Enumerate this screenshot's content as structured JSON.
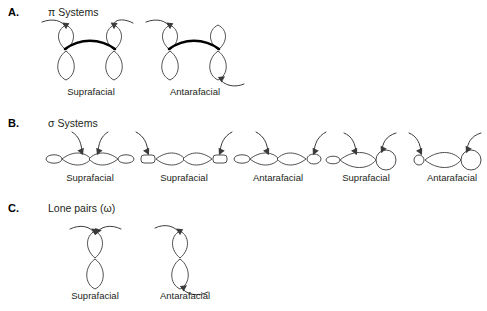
{
  "figure": {
    "background": "#ffffff",
    "line_color": "#4d4d4d",
    "bond_color": "#000000",
    "text_color": "#231f20"
  },
  "sections": [
    {
      "letter": "A.",
      "title": "π Systems",
      "items": [
        {
          "caption": "Suprafacial",
          "orbital": "pi-pair",
          "mode": "suprafacial"
        },
        {
          "caption": "Antarafacial",
          "orbital": "pi-pair",
          "mode": "antarafacial"
        }
      ]
    },
    {
      "letter": "B.",
      "title": "σ Systems",
      "items": [
        {
          "caption": "Suprafacial",
          "orbital": "sigma-symmetric",
          "mode": "suprafacial"
        },
        {
          "caption": "Suprafacial",
          "orbital": "sigma-symmetric",
          "mode": "suprafacial"
        },
        {
          "caption": "Antarafacial",
          "orbital": "sigma-symmetric",
          "mode": "antarafacial"
        },
        {
          "caption": "Suprafacial",
          "orbital": "sigma-hybrid",
          "mode": "suprafacial"
        },
        {
          "caption": "Antarafacial",
          "orbital": "sigma-hybrid",
          "mode": "antarafacial"
        }
      ]
    },
    {
      "letter": "C.",
      "title": "Lone pairs (ω)",
      "items": [
        {
          "caption": "Suprafacial",
          "orbital": "p-single",
          "mode": "suprafacial"
        },
        {
          "caption": "Antarafacial",
          "orbital": "p-single",
          "mode": "antarafacial"
        }
      ]
    }
  ]
}
